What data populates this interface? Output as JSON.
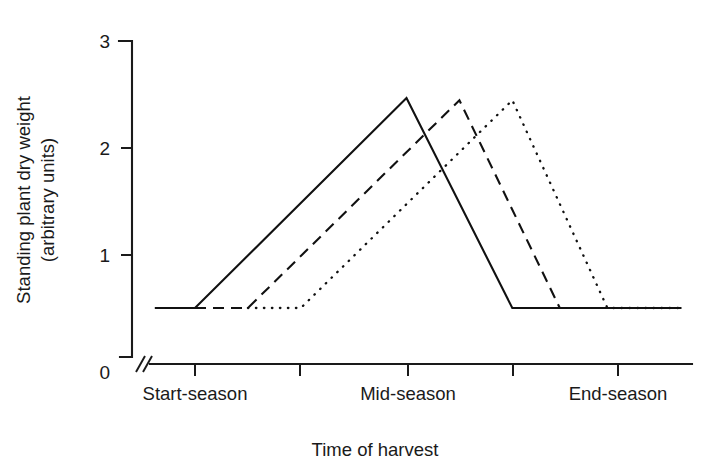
{
  "chart_data": {
    "type": "line",
    "title": "",
    "xlabel": "Time of harvest",
    "ylabel": "Standing plant dry weight\n(arbitrary units)",
    "ylabel_line1": "Standing plant dry weight",
    "ylabel_line2": "(arbitrary units)",
    "yticks": [
      "0",
      "1",
      "2",
      "3"
    ],
    "ytick_values": [
      0,
      1,
      2,
      3
    ],
    "ylim": [
      0,
      3
    ],
    "y_axis_break": true,
    "y_axis_break_symbol": "//",
    "xtick_count": 5,
    "xtick_values": [
      1,
      2,
      3,
      4,
      5
    ],
    "categories": [
      "Start-season",
      "",
      "Mid-season",
      "",
      "End-season"
    ],
    "xtick_labels": [
      "Start-season",
      "Mid-season",
      "End-season"
    ],
    "xtick_labeled_positions": [
      1,
      3,
      5
    ],
    "xlim": [
      0.5,
      5.6
    ],
    "grid": false,
    "legend": "none",
    "baseline_value": 0.52,
    "series": [
      {
        "name": "early-cohort",
        "style": "solid",
        "color": "#111111",
        "x": [
          0.62,
          1.0,
          3.0,
          4.0,
          5.6
        ],
        "values": [
          0.52,
          0.52,
          2.47,
          0.52,
          0.52
        ],
        "peak_x": 3.0,
        "peak_value": 2.47
      },
      {
        "name": "mid-cohort",
        "style": "dashed",
        "color": "#111111",
        "x": [
          1.0,
          1.5,
          3.5,
          4.45,
          5.6
        ],
        "values": [
          0.52,
          0.52,
          2.45,
          0.52,
          0.52
        ],
        "peak_x": 3.5,
        "peak_value": 2.45
      },
      {
        "name": "late-cohort",
        "style": "dotted",
        "color": "#111111",
        "x": [
          1.5,
          2.0,
          4.0,
          4.9,
          5.6
        ],
        "values": [
          0.52,
          0.52,
          2.45,
          0.52,
          0.52
        ],
        "peak_x": 4.0,
        "peak_value": 2.45
      }
    ]
  },
  "axes": {
    "y_tick_0": "0",
    "y_tick_1": "1",
    "y_tick_2": "2",
    "y_tick_3": "3",
    "x_label_start": "Start-season",
    "x_label_mid": "Mid-season",
    "x_label_end": "End-season",
    "x_title": "Time of harvest",
    "y_title_line1": "Standing plant dry weight",
    "y_title_line2": "(arbitrary units)"
  }
}
